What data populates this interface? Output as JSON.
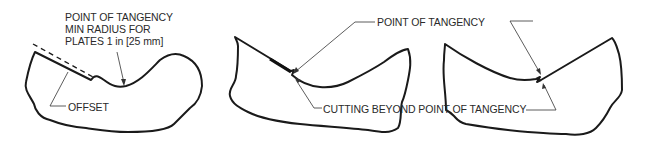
{
  "figure": {
    "panels": [
      {
        "id": "proper-offset",
        "labels": {
          "top": [
            "POINT OF TANGENCY",
            "MIN RADIUS FOR",
            "PLATES 1 in [25 mm]"
          ],
          "bottom": "OFFSET"
        }
      },
      {
        "id": "cut-beyond-left",
        "labels": {
          "top": "POINT OF TANGENCY",
          "bottom": "CUTTING BEYOND POINT OF TANGENCY"
        }
      },
      {
        "id": "cut-beyond-right",
        "labels": {}
      }
    ],
    "shared_labels": {
      "point_of_tangency": "POINT OF TANGENCY",
      "cutting_beyond": "CUTTING BEYOND POINT OF TANGENCY"
    },
    "colors": {
      "line": "#1a1a1a",
      "text": "#2a2a2a",
      "background": "#ffffff"
    }
  }
}
